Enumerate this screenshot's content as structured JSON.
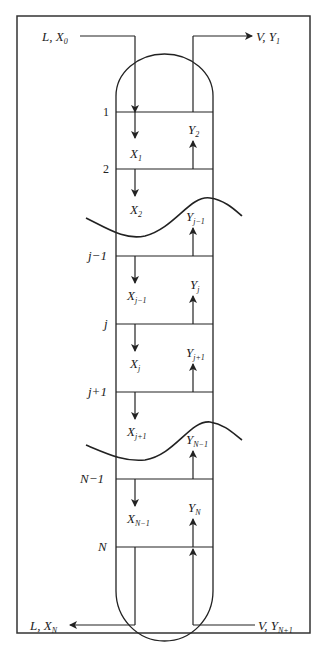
{
  "diagram": {
    "inlets_outlets": {
      "top_liquid_in": {
        "main": "L, X",
        "sub": "0"
      },
      "top_vapor_out": {
        "main": "V, Y",
        "sub": "1"
      },
      "bottom_liquid_out": {
        "main": "L, X",
        "sub": "N"
      },
      "bottom_vapor_in": {
        "main": "V, Y",
        "sub": "N+1"
      }
    },
    "stage_labels": [
      "1",
      "2",
      "j−1",
      "j",
      "j+1",
      "N−1",
      "N"
    ],
    "liquid_streams": [
      {
        "main": "X",
        "sub": "1"
      },
      {
        "main": "X",
        "sub": "2"
      },
      {
        "main": "X",
        "sub": "j−1"
      },
      {
        "main": "X",
        "sub": "j"
      },
      {
        "main": "X",
        "sub": "j+1"
      },
      {
        "main": "X",
        "sub": "N−1"
      }
    ],
    "vapor_streams": [
      {
        "main": "Y",
        "sub": "2"
      },
      {
        "main": "Y",
        "sub": "j−1"
      },
      {
        "main": "Y",
        "sub": "j"
      },
      {
        "main": "Y",
        "sub": "j+1"
      },
      {
        "main": "Y",
        "sub": "N−1"
      },
      {
        "main": "Y",
        "sub": "N"
      }
    ],
    "colors": {
      "line": "#222222",
      "frame": "#333333",
      "background": "#ffffff"
    }
  }
}
